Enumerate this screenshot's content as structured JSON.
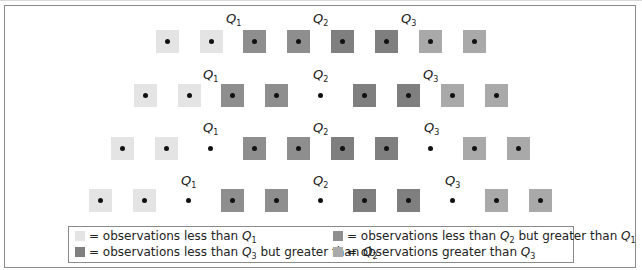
{
  "colors": {
    "lt_q1": "#e4e4e4",
    "q1_q2": "#8e8e8e",
    "q2_q3": "#7f7f7f",
    "gt_q3": "#a9a9a9",
    "dot": "#111111"
  },
  "rows": [
    {
      "n": 8,
      "top": 30,
      "cells": [
        {
          "cx": 167,
          "type": "lt_q1"
        },
        {
          "cx": 211,
          "type": "lt_q1"
        },
        {
          "cx": 254,
          "type": "q1_q2"
        },
        {
          "cx": 298,
          "type": "q1_q2"
        },
        {
          "cx": 342,
          "type": "q2_q3"
        },
        {
          "cx": 386,
          "type": "q2_q3"
        },
        {
          "cx": 430,
          "type": "gt_q3"
        },
        {
          "cx": 474,
          "type": "gt_q3"
        }
      ],
      "labels": [
        {
          "text": "Q",
          "sub": "1",
          "x": 226,
          "y": 12
        },
        {
          "text": "Q",
          "sub": "2",
          "x": 313,
          "y": 12
        },
        {
          "text": "Q",
          "sub": "3",
          "x": 401,
          "y": 12
        }
      ]
    },
    {
      "n": 9,
      "top": 84,
      "cells": [
        {
          "cx": 145,
          "type": "lt_q1"
        },
        {
          "cx": 189,
          "type": "lt_q1"
        },
        {
          "cx": 232,
          "type": "q1_q2"
        },
        {
          "cx": 276,
          "type": "q1_q2"
        },
        {
          "cx": 320,
          "type": "bare"
        },
        {
          "cx": 364,
          "type": "q2_q3"
        },
        {
          "cx": 408,
          "type": "q2_q3"
        },
        {
          "cx": 452,
          "type": "gt_q3"
        },
        {
          "cx": 496,
          "type": "gt_q3"
        }
      ],
      "labels": [
        {
          "text": "Q",
          "sub": "1",
          "x": 203,
          "y": 68
        },
        {
          "text": "Q",
          "sub": "2",
          "x": 313,
          "y": 68
        },
        {
          "text": "Q",
          "sub": "3",
          "x": 423,
          "y": 68
        }
      ]
    },
    {
      "n": 10,
      "top": 137,
      "cells": [
        {
          "cx": 122,
          "type": "lt_q1"
        },
        {
          "cx": 166,
          "type": "lt_q1"
        },
        {
          "cx": 210,
          "type": "bare"
        },
        {
          "cx": 254,
          "type": "q1_q2"
        },
        {
          "cx": 298,
          "type": "q1_q2"
        },
        {
          "cx": 342,
          "type": "q2_q3"
        },
        {
          "cx": 386,
          "type": "q2_q3"
        },
        {
          "cx": 430,
          "type": "bare"
        },
        {
          "cx": 474,
          "type": "gt_q3"
        },
        {
          "cx": 518,
          "type": "gt_q3"
        }
      ],
      "labels": [
        {
          "text": "Q",
          "sub": "1",
          "x": 203,
          "y": 121
        },
        {
          "text": "Q",
          "sub": "2",
          "x": 313,
          "y": 121
        },
        {
          "text": "Q",
          "sub": "3",
          "x": 424,
          "y": 121
        }
      ]
    },
    {
      "n": 11,
      "top": 189,
      "cells": [
        {
          "cx": 100,
          "type": "lt_q1"
        },
        {
          "cx": 144,
          "type": "lt_q1"
        },
        {
          "cx": 188,
          "type": "bare"
        },
        {
          "cx": 232,
          "type": "q1_q2"
        },
        {
          "cx": 276,
          "type": "q1_q2"
        },
        {
          "cx": 320,
          "type": "bare"
        },
        {
          "cx": 364,
          "type": "q2_q3"
        },
        {
          "cx": 408,
          "type": "q2_q3"
        },
        {
          "cx": 452,
          "type": "bare"
        },
        {
          "cx": 496,
          "type": "gt_q3"
        },
        {
          "cx": 540,
          "type": "gt_q3"
        }
      ],
      "labels": [
        {
          "text": "Q",
          "sub": "1",
          "x": 181,
          "y": 174
        },
        {
          "text": "Q",
          "sub": "2",
          "x": 313,
          "y": 174
        },
        {
          "text": "Q",
          "sub": "3",
          "x": 445,
          "y": 174
        }
      ]
    }
  ],
  "legend": {
    "items": [
      {
        "type": "lt_q1",
        "prefix": "= observations less than ",
        "q1": "Q",
        "s1": "1",
        "mid": "",
        "q2": "",
        "s2": ""
      },
      {
        "type": "q1_q2",
        "prefix": "= observations less than ",
        "q1": "Q",
        "s1": "2",
        "mid": " but greater than ",
        "q2": "Q",
        "s2": "1"
      },
      {
        "type": "q2_q3",
        "prefix": "= observations less than ",
        "q1": "Q",
        "s1": "3",
        "mid": " but greater than ",
        "q2": "Q",
        "s2": "2"
      },
      {
        "type": "gt_q3",
        "prefix": "= observations greater than ",
        "q1": "Q",
        "s1": "3",
        "mid": "",
        "q2": "",
        "s2": ""
      }
    ]
  }
}
